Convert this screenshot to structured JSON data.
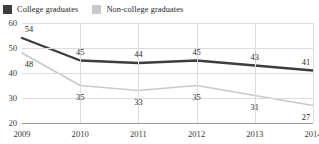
{
  "legend": {
    "position": "top-left",
    "items": [
      {
        "label": "College graduates",
        "color": "#3d3d3d",
        "marker": "square-swatch"
      },
      {
        "label": "Non-college graduates",
        "color": "#c9c9c9",
        "marker": "square-swatch"
      }
    ]
  },
  "chart_data": {
    "type": "line",
    "title": "",
    "xlabel": "",
    "ylabel": "",
    "categories": [
      "2009",
      "2010",
      "2011",
      "2012",
      "2013",
      "2014"
    ],
    "series": [
      {
        "name": "College graduates",
        "values": [
          54,
          45,
          44,
          45,
          43,
          41
        ],
        "color": "#3d3d3d",
        "line_width": 2.4,
        "label_position": "above"
      },
      {
        "name": "Non-college graduates",
        "values": [
          48,
          35,
          33,
          35,
          31,
          27
        ],
        "color": "#c9c9c9",
        "line_width": 1.6,
        "label_position": "below"
      }
    ],
    "ylim": [
      20,
      60
    ],
    "yticks": [
      60,
      50,
      40,
      30,
      20
    ],
    "grid": {
      "horizontal": true,
      "vertical": true,
      "color": "#dcdcdc"
    },
    "axis_color": "#9a9a9a",
    "legend_position": "top-left"
  }
}
